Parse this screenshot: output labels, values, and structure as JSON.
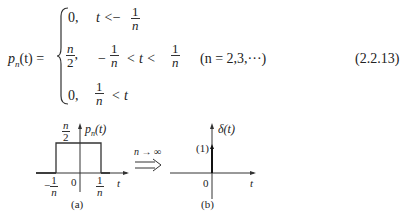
{
  "equation": {
    "lhs": "p",
    "lhs_sub": "n",
    "lhs_arg": "(t) =",
    "cases": [
      {
        "value": "0,",
        "cond_pre": "t <",
        "cond_frac_sign": "−",
        "cond_frac_num": "1",
        "cond_frac_den": "n"
      },
      {
        "value_num": "n",
        "value_den": "2",
        "value_suffix": ",",
        "cond_pre_sign": "−",
        "cond_frac_num": "1",
        "cond_frac_den": "n",
        "cond_mid": "< t <",
        "cond_frac2_num": "1",
        "cond_frac2_den": "n"
      },
      {
        "value": "0,",
        "cond_frac_num": "1",
        "cond_frac_den": "n",
        "cond_post": "< t"
      }
    ],
    "condition": "(n = 2,3,···)",
    "number": "(2.2.13)"
  },
  "figure_a": {
    "height_label_num": "n",
    "height_label_den": "2",
    "ylabel": "p",
    "ylabel_sub": "n",
    "ylabel_arg": "(t)",
    "xlabel": "t",
    "origin": "0",
    "left_tick_sign": "−",
    "left_tick_num": "1",
    "left_tick_den": "n",
    "right_tick_num": "1",
    "right_tick_den": "n",
    "caption": "(a)"
  },
  "arrow": {
    "label": "n → ∞"
  },
  "figure_b": {
    "ylabel": "δ(t)",
    "impulse_label": "(1)",
    "xlabel": "t",
    "origin": "0",
    "caption": "(b)"
  }
}
